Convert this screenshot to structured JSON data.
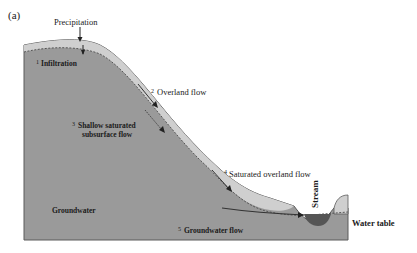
{
  "figure": {
    "panel_label": "(a)",
    "colors": {
      "ground": "#9a9a9a",
      "soil_layer": "#cfcfcf",
      "stream_water": "#555555",
      "outline": "#5a5a5a",
      "text": "#1a1a1a"
    }
  },
  "labels": {
    "precipitation": "Precipitation",
    "infiltration_num": "1",
    "infiltration": "Infiltration",
    "overland_num": "2",
    "overland": "Overland flow",
    "shallow_num": "3",
    "shallow_line1": "Shallow saturated",
    "shallow_line2": "subsurface flow",
    "saturated_num": "4",
    "saturated": "Saturated overland flow",
    "groundwater": "Groundwater",
    "gwflow_num": "5",
    "gwflow": "Groundwater flow",
    "stream": "Stream",
    "water_table": "Water table"
  }
}
